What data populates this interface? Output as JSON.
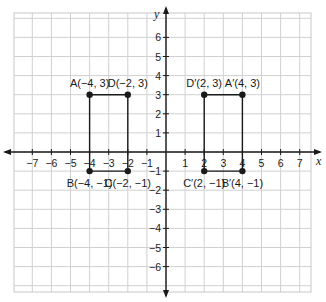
{
  "chart_data": {
    "type": "scatter",
    "title": "",
    "xlabel": "x",
    "ylabel": "y",
    "xlim": [
      -7,
      7
    ],
    "ylim": [
      -6,
      6
    ],
    "grid": true,
    "x_ticks": [
      "−7",
      "−6",
      "−5",
      "−4",
      "−3",
      "−2",
      "−1",
      "1",
      "2",
      "3",
      "4",
      "5",
      "6",
      "7"
    ],
    "y_ticks": [
      "6",
      "5",
      "4",
      "3",
      "2",
      "1",
      "−1",
      "−2",
      "−3",
      "−4",
      "−5",
      "−6"
    ],
    "series": [
      {
        "name": "ABCD",
        "closed_shape": "open-rectangle (A-B, A-D, B-C, D-C sides)",
        "points": [
          {
            "label": "A(−4, 3)",
            "x": -4,
            "y": 3
          },
          {
            "label": "D(−2, 3)",
            "x": -2,
            "y": 3
          },
          {
            "label": "C(−2, −1)",
            "x": -2,
            "y": -1
          },
          {
            "label": "B(−4, −1)",
            "x": -4,
            "y": -1
          }
        ]
      },
      {
        "name": "A'B'C'D'",
        "points": [
          {
            "label": "D′(2, 3)",
            "x": 2,
            "y": 3
          },
          {
            "label": "A′(4, 3)",
            "x": 4,
            "y": 3
          },
          {
            "label": "B′(4, −1)",
            "x": 4,
            "y": -1
          },
          {
            "label": "C′(2, −1)",
            "x": 2,
            "y": -1
          }
        ]
      }
    ]
  },
  "colors": {
    "grid": "#d0d0d0",
    "border": "#c8c8c8",
    "axis": "#1a1a1a",
    "shape": "#1a1a1a"
  }
}
